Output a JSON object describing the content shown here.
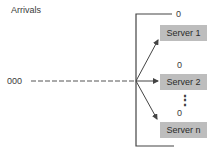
{
  "diagram": {
    "title": "Arrivals",
    "arrival_queue": "000",
    "servers": [
      {
        "label": "Server 1",
        "queue": "0"
      },
      {
        "label": "Server 2",
        "queue": "0"
      },
      {
        "label": "Server n",
        "queue": "0"
      }
    ],
    "ellipsis": "⋮",
    "colors": {
      "server_fill": "#bdbdbd",
      "line": "#444444"
    }
  }
}
